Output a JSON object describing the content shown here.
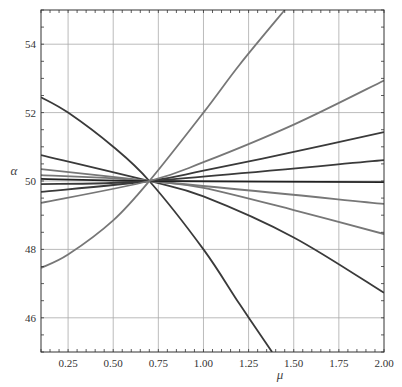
{
  "chart_data": {
    "type": "line",
    "title": "",
    "xlabel": "μ",
    "ylabel": "α",
    "xlim": [
      0.1,
      2.0
    ],
    "ylim": [
      45,
      55
    ],
    "grid": true,
    "legend": null,
    "x_ticks": [
      0.25,
      0.5,
      0.75,
      1.0,
      1.25,
      1.5,
      1.75,
      2.0
    ],
    "x_tick_labels": [
      "0.25",
      "0.50",
      "0.75",
      "1.00",
      "1.25",
      "1.50",
      "1.75",
      "2.00"
    ],
    "y_ticks": [
      46,
      48,
      50,
      52,
      54
    ],
    "y_tick_labels": [
      "46",
      "48",
      "50",
      "52",
      "54"
    ],
    "crossing_point": {
      "x": 0.7,
      "y": 50.0
    },
    "series": [
      {
        "name": "curve-1",
        "color": "#3a3a3a",
        "points": [
          [
            0.1,
            52.45
          ],
          [
            0.25,
            52.0
          ],
          [
            0.5,
            51.0
          ],
          [
            0.7,
            50.0
          ],
          [
            1.0,
            48.0
          ],
          [
            1.2,
            46.4
          ],
          [
            1.38,
            45.0
          ]
        ]
      },
      {
        "name": "curve-2",
        "color": "#3a3a3a",
        "points": [
          [
            0.1,
            50.76
          ],
          [
            0.7,
            50.0
          ],
          [
            1.0,
            49.55
          ],
          [
            1.5,
            48.35
          ],
          [
            2.0,
            46.73
          ]
        ]
      },
      {
        "name": "curve-3",
        "color": "#777777",
        "points": [
          [
            0.1,
            50.35
          ],
          [
            0.7,
            50.0
          ],
          [
            1.0,
            49.8
          ],
          [
            1.5,
            49.15
          ],
          [
            2.0,
            48.45
          ]
        ]
      },
      {
        "name": "curve-4",
        "color": "#777777",
        "points": [
          [
            0.1,
            50.17
          ],
          [
            0.7,
            50.0
          ],
          [
            2.0,
            49.33
          ]
        ]
      },
      {
        "name": "curve-5",
        "color": "#222222",
        "points": [
          [
            0.1,
            50.06
          ],
          [
            0.7,
            50.0
          ],
          [
            2.0,
            49.97
          ]
        ]
      },
      {
        "name": "curve-6",
        "color": "#3a3a3a",
        "points": [
          [
            0.1,
            49.91
          ],
          [
            0.7,
            50.0
          ],
          [
            2.0,
            50.61
          ]
        ]
      },
      {
        "name": "curve-7",
        "color": "#3a3a3a",
        "points": [
          [
            0.1,
            49.68
          ],
          [
            0.7,
            50.0
          ],
          [
            1.0,
            50.3
          ],
          [
            1.5,
            50.85
          ],
          [
            2.0,
            51.43
          ]
        ]
      },
      {
        "name": "curve-8",
        "color": "#777777",
        "points": [
          [
            0.1,
            49.36
          ],
          [
            0.7,
            50.0
          ],
          [
            1.0,
            50.55
          ],
          [
            1.5,
            51.65
          ],
          [
            2.0,
            52.94
          ]
        ]
      },
      {
        "name": "curve-9",
        "color": "#777777",
        "points": [
          [
            0.1,
            47.46
          ],
          [
            0.25,
            47.85
          ],
          [
            0.5,
            48.85
          ],
          [
            0.7,
            50.0
          ],
          [
            1.0,
            52.0
          ],
          [
            1.2,
            53.4
          ],
          [
            1.45,
            55.0
          ]
        ]
      }
    ]
  }
}
